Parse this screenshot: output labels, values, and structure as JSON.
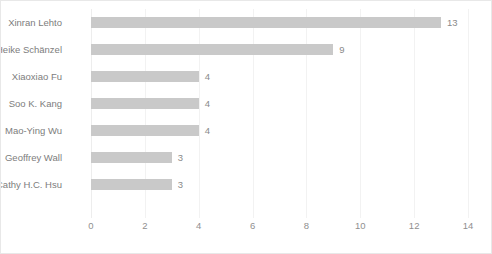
{
  "chart_data": {
    "type": "bar",
    "orientation": "horizontal",
    "title": "",
    "xlabel": "",
    "ylabel": "",
    "xlim": [
      0,
      14
    ],
    "xticks": [
      0,
      2,
      4,
      6,
      8,
      10,
      12,
      14
    ],
    "grid": true,
    "legend": false,
    "categories": [
      "Xinran  Lehto",
      "Heike  Schänzel",
      "Xiaoxiao Fu",
      "Soo K. Kang",
      "Mao-Ying Wu",
      "Geoffrey Wall",
      "Cathy H.C. Hsu"
    ],
    "values": [
      13,
      9,
      4,
      4,
      4,
      3,
      3
    ],
    "data_labels": [
      "13",
      "9",
      "4",
      "4",
      "4",
      "3",
      "3"
    ],
    "colors": {
      "bar": "#c9c9c9",
      "text": "#7d7d7d",
      "tick": "#8f8f8f",
      "grid": "#f2f2f2",
      "background": "#ffffff",
      "border": "#e8e8e8"
    }
  }
}
